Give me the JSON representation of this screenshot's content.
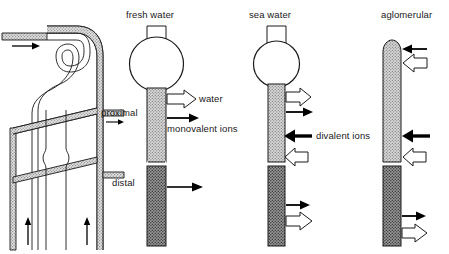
{
  "figure": {
    "type": "biological-schematic-diagram",
    "background_color": "#ffffff",
    "panel_count": 4
  },
  "colors": {
    "outline": "#1a1a1a",
    "text": "#1a1a1a",
    "proximal_fill": "#c8c8c8",
    "distal_fill": "#8a8a8a",
    "open_arrow_fill": "#ffffff",
    "solid_arrow_fill": "#000000",
    "hatch_fill": "#b5b5b5"
  },
  "panels": [
    {
      "id": "nephron-detail",
      "label": "",
      "description": "detailed looped nephron tubule drawing with inflow arrow and upward flow arrows"
    },
    {
      "id": "fresh-water",
      "label": "fresh water",
      "segments": [
        "proximal",
        "distal"
      ],
      "arrows": [
        {
          "name": "water",
          "style": "open",
          "direction": "right"
        },
        {
          "name": "monovalent ions",
          "style": "solid",
          "direction": "right"
        },
        {
          "name": "distal-outflow",
          "style": "solid",
          "direction": "right"
        }
      ]
    },
    {
      "id": "sea-water",
      "label": "sea water",
      "segments": [
        "proximal",
        "distal"
      ],
      "arrows": [
        {
          "name": "water-out",
          "style": "open",
          "direction": "right"
        },
        {
          "name": "monovalent-out",
          "style": "solid",
          "direction": "right"
        },
        {
          "name": "divalent ions",
          "style": "solid",
          "direction": "left"
        },
        {
          "name": "secretion-out",
          "style": "open",
          "direction": "left"
        },
        {
          "name": "distal-solid-out",
          "style": "solid",
          "direction": "right"
        },
        {
          "name": "distal-open-out",
          "style": "open",
          "direction": "right"
        }
      ]
    },
    {
      "id": "aglomerular",
      "label": "aglomerular",
      "segments": [
        "proximal",
        "distal"
      ],
      "arrows": [
        {
          "name": "top-solid-in",
          "style": "solid",
          "direction": "left"
        },
        {
          "name": "top-open-in",
          "style": "open",
          "direction": "left"
        },
        {
          "name": "divalent-in",
          "style": "solid",
          "direction": "left"
        },
        {
          "name": "mid-open-in",
          "style": "open",
          "direction": "left"
        },
        {
          "name": "distal-solid-out",
          "style": "solid",
          "direction": "right"
        },
        {
          "name": "distal-open-out",
          "style": "open",
          "direction": "right"
        }
      ]
    }
  ],
  "labels": {
    "fresh_water": "fresh water",
    "sea_water": "sea water",
    "aglomerular": "aglomerular",
    "proximal": "proximal",
    "distal": "distal",
    "water": "water",
    "monovalent_ions": "monovalent ions",
    "divalent_ions": "divalent ions"
  }
}
